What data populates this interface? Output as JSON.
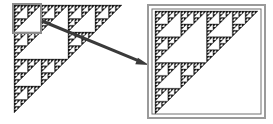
{
  "figure": {
    "width": 273,
    "height": 124,
    "background_color": "#ffffff"
  },
  "colors": {
    "fractal_fill": "#1a1a1a",
    "fractal_stroke": "#1a1a1a",
    "selection_box_stroke": "#8c8c8c",
    "magnified_outer_border": "#9a9a9a",
    "magnified_inner_border": "#707070",
    "arrow_color": "#3a3a3a",
    "canvas": "#ffffff"
  },
  "left_panel": {
    "name": "source-fractal",
    "label": "Sierpinski right triangle",
    "origin_x": 14,
    "origin_y": 5,
    "size": 108,
    "recursion_depth": 5,
    "orientation": "right-angle-top-left"
  },
  "selection": {
    "name": "zoom-selection-region",
    "x": 13,
    "y": 4,
    "width": 28,
    "height": 29,
    "stroke_width": 2,
    "label": "Selected sub-triangle"
  },
  "arrow": {
    "name": "magnify-arrow",
    "start_x": 42,
    "start_y": 21,
    "end_x": 149,
    "end_y": 65,
    "stroke_width": 3,
    "head_length": 13,
    "head_width": 9,
    "label": "magnify"
  },
  "right_panel": {
    "name": "magnified-fractal",
    "label": "Magnified sub-triangle",
    "outer_box": {
      "x": 148,
      "y": 5,
      "width": 117,
      "height": 113,
      "stroke_width": 2
    },
    "inner_box": {
      "x": 152,
      "y": 9,
      "width": 109,
      "height": 105,
      "stroke_width": 1
    },
    "origin_x": 155,
    "origin_y": 11,
    "size": 103,
    "recursion_depth": 5,
    "orientation": "right-angle-top-left"
  },
  "chart_data": {
    "type": "diagram",
    "elements": [
      {
        "id": "source-fractal",
        "kind": "fractal",
        "depth": 5
      },
      {
        "id": "zoom-selection-region",
        "kind": "rectangle"
      },
      {
        "id": "magnify-arrow",
        "kind": "arrow"
      },
      {
        "id": "magnified-fractal",
        "kind": "fractal",
        "depth": 5
      }
    ]
  }
}
